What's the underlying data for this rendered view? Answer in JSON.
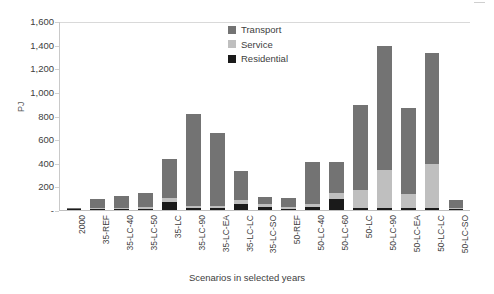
{
  "chart_data": {
    "type": "bar",
    "stacked": true,
    "title": "",
    "xlabel": "Scenarios in selected years",
    "ylabel": "PJ",
    "ylim": [
      0,
      1600
    ],
    "ytick_step": 200,
    "grid": false,
    "legend_position": "top-center",
    "categories": [
      "2000",
      "35-REF",
      "35-LC-40",
      "35-LC-50",
      "35-LC",
      "35-LC-90",
      "35-LC-EA",
      "35-LC-LC",
      "35-LC-SO",
      "50-REF",
      "50-LC-40",
      "50-LC-60",
      "50-LC",
      "50-LC-90",
      "50-LC-EA",
      "50-LC-LC",
      "50-LC-SO"
    ],
    "series": [
      {
        "name": "Residential",
        "color": "#1a1a1a",
        "values": [
          5,
          8,
          10,
          12,
          70,
          15,
          15,
          55,
          25,
          12,
          22,
          90,
          18,
          18,
          18,
          18,
          8
        ]
      },
      {
        "name": "Service",
        "color": "#bfbfbf",
        "values": [
          3,
          6,
          8,
          10,
          30,
          20,
          20,
          30,
          25,
          10,
          25,
          55,
          150,
          320,
          115,
          370,
          12
        ]
      },
      {
        "name": "Transport",
        "color": "#737373",
        "values": [
          6,
          76,
          102,
          118,
          330,
          775,
          615,
          245,
          60,
          78,
          363,
          265,
          720,
          1052,
          727,
          945,
          65
        ]
      }
    ],
    "y_ticks": [
      "-",
      "200",
      "400",
      "600",
      "800",
      "1,000",
      "1,200",
      "1,400",
      "1,600"
    ],
    "legend": [
      {
        "label": "Transport",
        "color": "#737373"
      },
      {
        "label": "Service",
        "color": "#bfbfbf"
      },
      {
        "label": "Residential",
        "color": "#1a1a1a"
      }
    ]
  }
}
